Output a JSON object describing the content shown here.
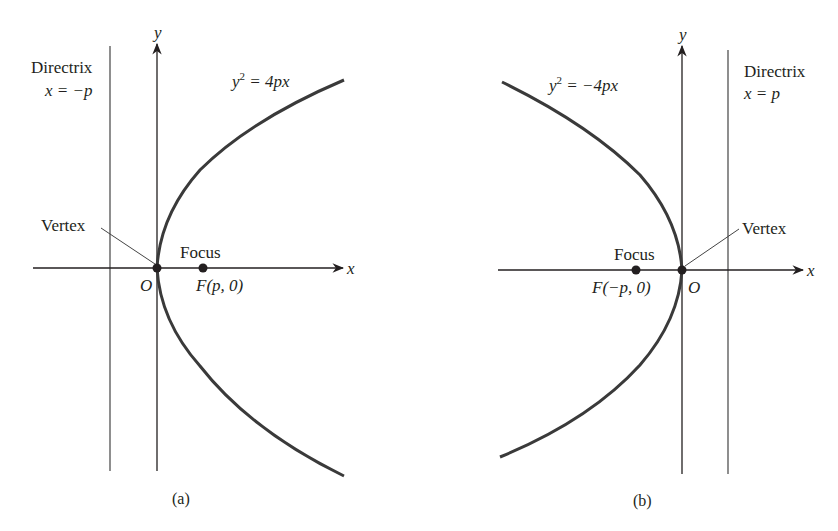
{
  "figure_a": {
    "caption": "(a)",
    "directrix_label": "Directrix",
    "directrix_eq": "x = −p",
    "equation_lhs": "y",
    "equation_exp": "2",
    "equation_rhs": " = 4px",
    "vertex_label": "Vertex",
    "focus_label": "Focus",
    "focus_point": "F(p, 0)",
    "origin_label": "O",
    "x_axis_label": "x",
    "y_axis_label": "y"
  },
  "figure_b": {
    "caption": "(b)",
    "directrix_label": "Directrix",
    "directrix_eq": "x =  p",
    "equation_lhs": "y",
    "equation_exp": "2",
    "equation_rhs": " = −4px",
    "vertex_label": "Vertex",
    "focus_label": "Focus",
    "focus_point": "F(−p, 0)",
    "origin_label": "O",
    "x_axis_label": "x",
    "y_axis_label": "y"
  },
  "colors": {
    "ink": "#231f20",
    "curve": "#3a3a3a"
  }
}
